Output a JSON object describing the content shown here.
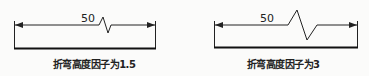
{
  "figures": [
    {
      "dimension_text": "50",
      "caption": "折弯高度因子为1.5",
      "jog_height_factor": 1.5
    },
    {
      "dimension_text": "50",
      "caption": "折弯高度因子为3",
      "jog_height_factor": 3
    }
  ],
  "colors": {
    "line": "#222222",
    "background": "#fbfbfa"
  }
}
